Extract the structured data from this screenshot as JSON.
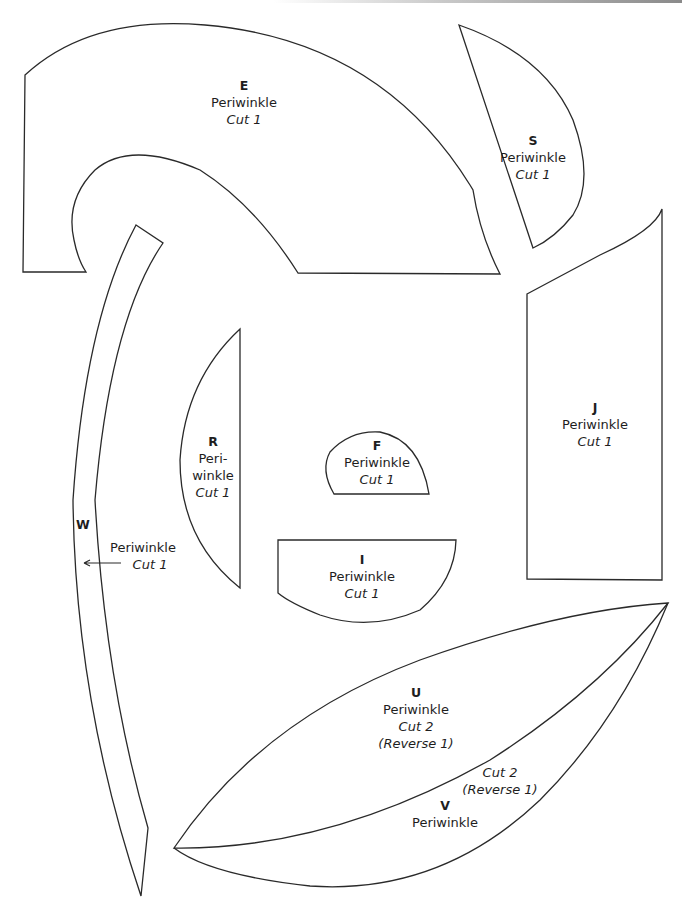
{
  "colors": {
    "stroke": "#2a2a2a",
    "text": "#1e1e1e",
    "background": "#ffffff"
  },
  "pieces": {
    "E": {
      "letter": "E",
      "color": "Periwinkle",
      "cut": "Cut 1"
    },
    "S": {
      "letter": "S",
      "color": "Periwinkle",
      "cut": "Cut 1"
    },
    "J": {
      "letter": "J",
      "color": "Periwinkle",
      "cut": "Cut 1"
    },
    "R": {
      "letter": "R",
      "color_line1": "Peri-",
      "color_line2": "winkle",
      "cut": "Cut 1"
    },
    "F": {
      "letter": "F",
      "color": "Periwinkle",
      "cut": "Cut 1"
    },
    "I": {
      "letter": "I",
      "color": "Periwinkle",
      "cut": "Cut 1"
    },
    "W": {
      "letter": "W",
      "color": "Periwinkle",
      "cut": "Cut 1",
      "arrow_icon": "arrow-left-icon"
    },
    "U": {
      "letter": "U",
      "color": "Periwinkle",
      "cut": "Cut 2",
      "reverse": "(Reverse 1)"
    },
    "V": {
      "letter": "V",
      "color": "Periwinkle",
      "cut": "Cut 2",
      "reverse": "(Reverse 1)"
    }
  }
}
